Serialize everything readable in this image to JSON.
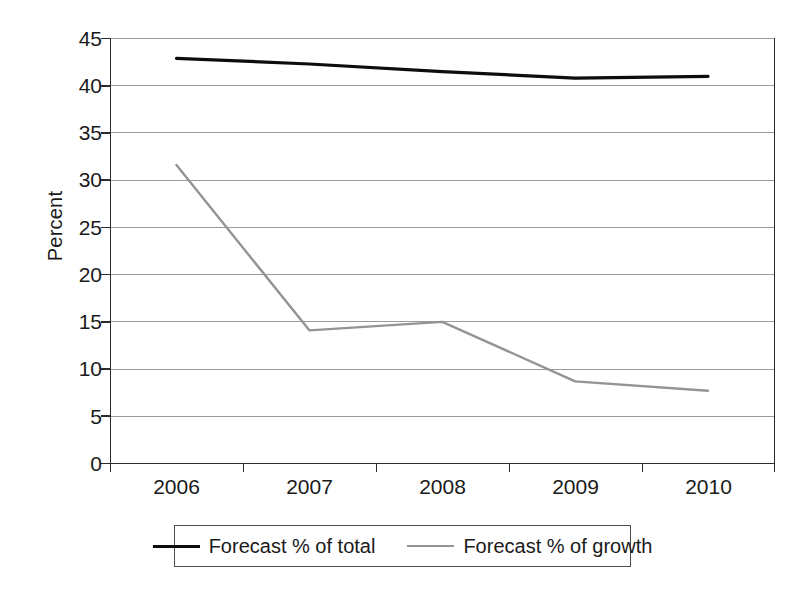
{
  "chart_data": {
    "type": "line",
    "title": "",
    "xlabel": "",
    "ylabel": "Percent",
    "categories": [
      "2006",
      "2007",
      "2008",
      "2009",
      "2010"
    ],
    "series": [
      {
        "name": "Forecast % of total",
        "color": "#0d0d0d",
        "values": [
          42.9,
          42.3,
          41.5,
          40.8,
          41.0
        ]
      },
      {
        "name": "Forecast % of growth",
        "color": "#949494",
        "values": [
          31.6,
          14.1,
          15.0,
          8.7,
          7.7
        ]
      }
    ],
    "ylim": [
      0,
      45
    ],
    "ytick_step": 5,
    "yticks": [
      "45",
      "40",
      "35",
      "30",
      "25",
      "20",
      "15",
      "10",
      "5",
      "0"
    ],
    "grid": "horizontal",
    "legend_position": "bottom",
    "legend_box": true
  },
  "axes": {
    "y_title": "Percent"
  },
  "legend": {
    "entries": [
      {
        "label": "Forecast % of total",
        "swatch": "line-swatch-black"
      },
      {
        "label": "Forecast % of growth",
        "swatch": "line-swatch-gray"
      }
    ]
  },
  "colors": {
    "series_total": "#0d0d0d",
    "series_growth": "#949494",
    "gridline": "#9a9a9a",
    "axis": "#2b2b2b",
    "background": "#ffffff"
  }
}
